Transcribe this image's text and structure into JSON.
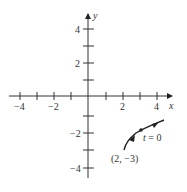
{
  "diagram": {
    "type": "parametric-curve-plot",
    "axes": {
      "x_label": "x",
      "y_label": "y",
      "x_ticks": [
        {
          "value": -4,
          "label": "−4"
        },
        {
          "value": -3,
          "label": ""
        },
        {
          "value": -2,
          "label": "−2"
        },
        {
          "value": -1,
          "label": ""
        },
        {
          "value": 1,
          "label": ""
        },
        {
          "value": 2,
          "label": "2"
        },
        {
          "value": 3,
          "label": ""
        },
        {
          "value": 4,
          "label": "4"
        }
      ],
      "y_ticks": [
        {
          "value": 4,
          "label": "4"
        },
        {
          "value": 3,
          "label": ""
        },
        {
          "value": 2,
          "label": "2"
        },
        {
          "value": 1,
          "label": ""
        },
        {
          "value": -1,
          "label": ""
        },
        {
          "value": -2,
          "label": "−2"
        },
        {
          "value": -3,
          "label": ""
        },
        {
          "value": -4,
          "label": "−4"
        }
      ],
      "range": {
        "x": [
          -4.5,
          4.6
        ],
        "y": [
          -4.8,
          5
        ]
      }
    },
    "curve": {
      "start_point": {
        "x": 2,
        "y": -3
      },
      "start_label": "(2, −3)",
      "marked_point": {
        "x": 3,
        "y": -2,
        "label": "t = 0"
      },
      "direction_arrows": 2,
      "color": "#222222"
    }
  }
}
